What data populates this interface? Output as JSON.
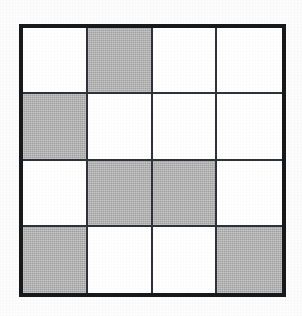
{
  "figure": {
    "name": "shaded-fraction-grid",
    "kind": "grid",
    "rows": 4,
    "columns": 4,
    "total_cells": 16,
    "shaded_count": 6,
    "unshaded_count": 10,
    "colors": {
      "shaded": "#b2b2b2",
      "unshaded": "#ffffff",
      "outer_border": "#17191a",
      "inner_line": "#30323a",
      "page_background": "#fdfdfd"
    },
    "cells": [
      {
        "row": 1,
        "col": 1,
        "state": "unshaded"
      },
      {
        "row": 1,
        "col": 2,
        "state": "shaded"
      },
      {
        "row": 1,
        "col": 3,
        "state": "unshaded"
      },
      {
        "row": 1,
        "col": 4,
        "state": "unshaded"
      },
      {
        "row": 2,
        "col": 1,
        "state": "shaded"
      },
      {
        "row": 2,
        "col": 2,
        "state": "unshaded"
      },
      {
        "row": 2,
        "col": 3,
        "state": "unshaded"
      },
      {
        "row": 2,
        "col": 4,
        "state": "unshaded"
      },
      {
        "row": 3,
        "col": 1,
        "state": "unshaded"
      },
      {
        "row": 3,
        "col": 2,
        "state": "shaded"
      },
      {
        "row": 3,
        "col": 3,
        "state": "shaded"
      },
      {
        "row": 3,
        "col": 4,
        "state": "unshaded"
      },
      {
        "row": 4,
        "col": 1,
        "state": "shaded"
      },
      {
        "row": 4,
        "col": 2,
        "state": "unshaded"
      },
      {
        "row": 4,
        "col": 3,
        "state": "unshaded"
      },
      {
        "row": 4,
        "col": 4,
        "state": "shaded"
      }
    ]
  }
}
